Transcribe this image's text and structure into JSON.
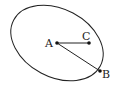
{
  "diagram": {
    "type": "geometry",
    "shapes": [
      {
        "kind": "ellipse",
        "cx": 57,
        "cy": 43,
        "rx": 49,
        "ry": 34,
        "rotation_deg": 28,
        "stroke": "#222222"
      }
    ],
    "points": [
      {
        "id": "A",
        "label": "A",
        "x": 57,
        "y": 43
      },
      {
        "id": "C",
        "label": "C",
        "x": 89,
        "y": 43
      },
      {
        "id": "B",
        "label": "B",
        "x": 100,
        "y": 71
      }
    ],
    "segments": [
      {
        "from": "A",
        "to": "C"
      },
      {
        "from": "A",
        "to": "B"
      }
    ]
  },
  "labels": {
    "A": "A",
    "B": "B",
    "C": "C"
  }
}
